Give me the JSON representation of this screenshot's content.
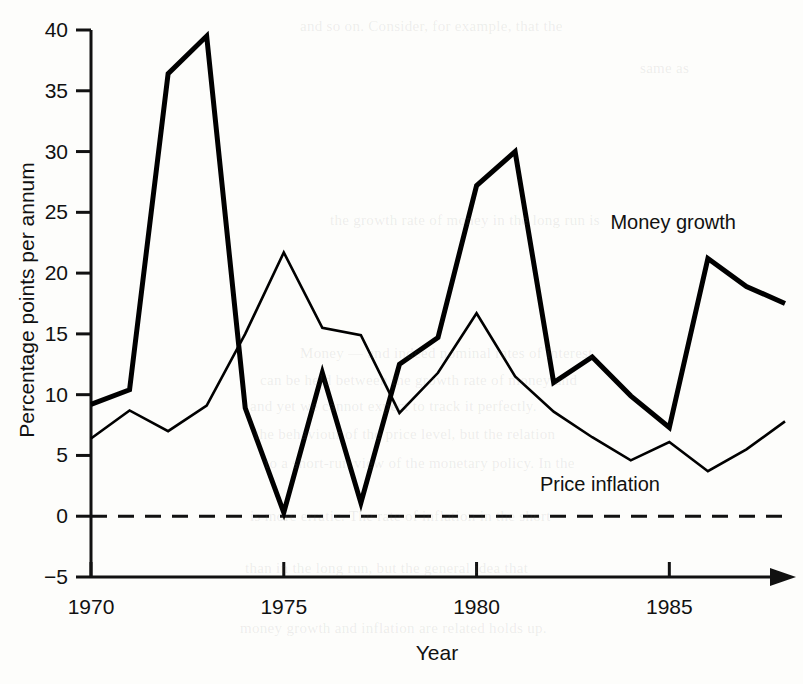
{
  "chart_data": {
    "type": "line",
    "title": "",
    "xlabel": "Year",
    "ylabel": "Percentage points per annum",
    "xlim": [
      1970,
      1988
    ],
    "ylim": [
      -5,
      40
    ],
    "grid": false,
    "legend_position": "inline-annotation",
    "x_ticks": [
      "1970",
      "1975",
      "1980",
      "1985"
    ],
    "x_tick_values": [
      1970,
      1975,
      1980,
      1985
    ],
    "y_ticks": [
      "40",
      "35",
      "30",
      "25",
      "20",
      "15",
      "10",
      "5",
      "0",
      "−5"
    ],
    "y_tick_values": [
      40,
      35,
      30,
      25,
      20,
      15,
      10,
      5,
      0,
      -5
    ],
    "zero_line": 0,
    "zero_line_style": "dashed",
    "x_axis_position": -5,
    "x_axis_arrow": true,
    "x": [
      1970,
      1971,
      1972,
      1973,
      1974,
      1975,
      1976,
      1977,
      1978,
      1979,
      1980,
      1981,
      1982,
      1983,
      1984,
      1985,
      1986,
      1987,
      1988
    ],
    "series": [
      {
        "name": "Money growth",
        "style": "thick",
        "color": "#000000",
        "width": 5,
        "values": [
          9.2,
          10.4,
          36.4,
          39.5,
          8.9,
          0.3,
          11.8,
          1.1,
          12.5,
          14.7,
          27.2,
          30.0,
          11.0,
          13.1,
          9.9,
          7.3,
          21.2,
          18.9,
          17.5
        ],
        "label": "Money growth",
        "label_x": 1985.1,
        "label_y": 23.6
      },
      {
        "name": "Price inflation",
        "style": "thin",
        "color": "#000000",
        "width": 2.6,
        "values": [
          6.4,
          8.7,
          7.0,
          9.1,
          15.0,
          21.7,
          15.5,
          14.9,
          8.5,
          11.8,
          16.7,
          11.5,
          8.6,
          6.5,
          4.6,
          6.1,
          3.7,
          5.5,
          7.8
        ],
        "label": "Price inflation",
        "label_x": 1983.2,
        "label_y": 2.1
      }
    ]
  },
  "axis": {
    "y_title": "Percentage points per annum",
    "x_title": "Year"
  },
  "annotations": {
    "money_growth": "Money growth",
    "price_inflation": "Price inflation"
  },
  "background_text": [
    "and so on. Consider, for example, that the",
    "same as",
    "the growth rate of money in the long run is",
    "Money — and indeed nominal rates of interest",
    "can be held between the growth rate of money and",
    "and yet we cannot expect to track it perfectly.",
    "the behaviour of the price level, but the relation",
    "to a short-run view of the monetary policy. In the",
    "is more erratic. The rate of inflation in the short",
    "than in the long run, but the general idea that",
    "money growth and inflation are related holds up."
  ]
}
